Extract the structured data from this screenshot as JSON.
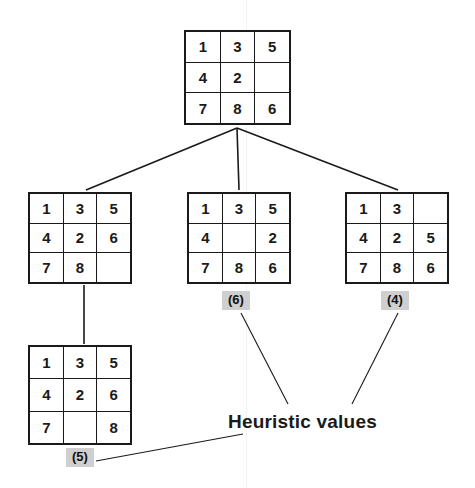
{
  "diagram": {
    "caption": "Heuristic values",
    "blank_cell": "",
    "nodes": [
      {
        "id": "root",
        "name": "root-node",
        "x": 184,
        "y": 30,
        "w": 107,
        "h": 95,
        "rows": [
          [
            "1",
            "3",
            "5"
          ],
          [
            "4",
            "2",
            ""
          ],
          [
            "7",
            "8",
            "6"
          ]
        ],
        "heuristic": null
      },
      {
        "id": "child-left",
        "name": "child-left-node",
        "x": 28,
        "y": 192,
        "w": 104,
        "h": 92,
        "rows": [
          [
            "1",
            "3",
            "5"
          ],
          [
            "4",
            "2",
            "6"
          ],
          [
            "7",
            "8",
            ""
          ]
        ],
        "heuristic": null
      },
      {
        "id": "child-middle",
        "name": "child-middle-node",
        "x": 187,
        "y": 192,
        "w": 104,
        "h": 92,
        "rows": [
          [
            "1",
            "3",
            "5"
          ],
          [
            "4",
            "",
            "2"
          ],
          [
            "7",
            "8",
            "6"
          ]
        ],
        "heuristic": "(6)",
        "hx": 222,
        "hy": 291
      },
      {
        "id": "child-right",
        "name": "child-right-node",
        "x": 345,
        "y": 192,
        "w": 104,
        "h": 92,
        "rows": [
          [
            "1",
            "3",
            ""
          ],
          [
            "4",
            "2",
            "5"
          ],
          [
            "7",
            "8",
            "6"
          ]
        ],
        "heuristic": "(4)",
        "hx": 381,
        "hy": 291
      },
      {
        "id": "grandchild",
        "name": "grandchild-node",
        "x": 28,
        "y": 345,
        "w": 104,
        "h": 100,
        "rows": [
          [
            "1",
            "3",
            "5"
          ],
          [
            "4",
            "2",
            "6"
          ],
          [
            "7",
            "",
            "8"
          ]
        ],
        "heuristic": "(5)",
        "hx": 66,
        "hy": 448
      }
    ],
    "edges": [
      {
        "name": "edge-root-to-left",
        "x1": 237,
        "y1": 128,
        "x2": 86,
        "y2": 190
      },
      {
        "name": "edge-root-to-middle",
        "x1": 237,
        "y1": 128,
        "x2": 239,
        "y2": 190
      },
      {
        "name": "edge-root-to-right",
        "x1": 237,
        "y1": 128,
        "x2": 398,
        "y2": 190
      },
      {
        "name": "edge-left-to-grandchild",
        "x1": 84,
        "y1": 285,
        "x2": 84,
        "y2": 344
      }
    ],
    "leader_lines": [
      {
        "name": "leader-line-middle-heuristic",
        "x1": 241,
        "y1": 313,
        "x2": 288,
        "y2": 404
      },
      {
        "name": "leader-line-right-heuristic",
        "x1": 398,
        "y1": 313,
        "x2": 352,
        "y2": 404
      },
      {
        "name": "leader-line-grandchild-heuristic",
        "x1": 96,
        "y1": 461,
        "x2": 243,
        "y2": 434
      }
    ],
    "caption_x": 228,
    "caption_y": 411,
    "colors": {
      "background": "#ffffff",
      "grid_line": "#1a1a1a",
      "text": "#1a1a1a",
      "heuristic_badge_bg": "#cfcfcf",
      "edge": "#1a1a1a"
    }
  }
}
